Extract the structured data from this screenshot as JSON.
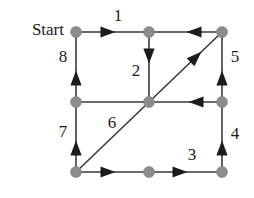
{
  "figure": {
    "type": "directed-graph-traversal",
    "background_color": "#ffffff",
    "node_color": "#8c8c8c",
    "edge_color": "#3a3a3a",
    "arrow_color": "#1c1c1c",
    "label_color": "#1a1a1a",
    "start_label": "Start"
  },
  "nodes": [
    {
      "id": "n-top-left",
      "cx": 76,
      "cy": 32,
      "r": 5.5
    },
    {
      "id": "n-top-mid",
      "cx": 149,
      "cy": 32,
      "r": 5.5
    },
    {
      "id": "n-top-right",
      "cx": 222,
      "cy": 32,
      "r": 5.5
    },
    {
      "id": "n-mid-left",
      "cx": 76,
      "cy": 102,
      "r": 5.5
    },
    {
      "id": "n-mid-center",
      "cx": 149,
      "cy": 102,
      "r": 5.5
    },
    {
      "id": "n-mid-right",
      "cx": 222,
      "cy": 102,
      "r": 5.5
    },
    {
      "id": "n-bottom-left",
      "cx": 76,
      "cy": 172,
      "r": 5.5
    },
    {
      "id": "n-bottom-mid",
      "cx": 149,
      "cy": 172,
      "r": 5.5
    },
    {
      "id": "n-bottom-right",
      "cx": 222,
      "cy": 172,
      "r": 5.5
    }
  ],
  "edges": [
    {
      "id": "edge-1",
      "label": "1",
      "from": "n-top-left",
      "to": "n-top-mid",
      "x1": 76,
      "y1": 32,
      "x2": 149,
      "y2": 32,
      "direction": "right",
      "arrow_x": 108,
      "arrow_y": 32,
      "label_x": 118,
      "label_y": 17
    },
    {
      "id": "edge-2",
      "label": "2",
      "from": "n-top-mid",
      "to": "n-mid-center",
      "x1": 149,
      "y1": 32,
      "x2": 149,
      "y2": 102,
      "direction": "down",
      "arrow_x": 149,
      "arrow_y": 56,
      "label_x": 136,
      "label_y": 72
    },
    {
      "id": "edge-3",
      "label": "3",
      "from": "n-bottom-mid",
      "to": "n-bottom-right",
      "x1": 149,
      "y1": 172,
      "x2": 222,
      "y2": 172,
      "direction": "right",
      "arrow_x": 180,
      "arrow_y": 172,
      "label_x": 192,
      "label_y": 156
    },
    {
      "id": "edge-4",
      "label": "4",
      "from": "n-bottom-right",
      "to": "n-mid-right",
      "x1": 222,
      "y1": 172,
      "x2": 222,
      "y2": 102,
      "direction": "up",
      "arrow_x": 222,
      "arrow_y": 148,
      "label_x": 235,
      "label_y": 135
    },
    {
      "id": "edge-5",
      "label": "5",
      "from": "n-mid-right",
      "to": "n-top-right",
      "x1": 222,
      "y1": 102,
      "x2": 222,
      "y2": 32,
      "direction": "up",
      "arrow_x": 222,
      "arrow_y": 78,
      "label_x": 235,
      "label_y": 58
    },
    {
      "id": "edge-6",
      "label": "6",
      "from": "n-bottom-left",
      "to": "n-top-right",
      "x1": 76,
      "y1": 172,
      "x2": 222,
      "y2": 32,
      "direction": "up-right",
      "arrow_x": 196,
      "arrow_y": 57,
      "label_x": 112,
      "label_y": 124
    },
    {
      "id": "edge-7",
      "label": "7",
      "from": "n-bottom-left",
      "to": "n-mid-left",
      "x1": 76,
      "y1": 172,
      "x2": 76,
      "y2": 102,
      "direction": "up",
      "arrow_x": 76,
      "arrow_y": 148,
      "label_x": 63,
      "label_y": 133
    },
    {
      "id": "edge-8",
      "label": "8",
      "from": "n-mid-left",
      "to": "n-top-left",
      "x1": 76,
      "y1": 102,
      "x2": 76,
      "y2": 32,
      "direction": "up",
      "arrow_x": 76,
      "arrow_y": 78,
      "label_x": 63,
      "label_y": 58
    },
    {
      "id": "edge-unlabeled-top-right",
      "label": "",
      "from": "n-top-right",
      "to": "n-top-mid",
      "x1": 222,
      "y1": 32,
      "x2": 149,
      "y2": 32,
      "direction": "left",
      "arrow_x": 194,
      "arrow_y": 32,
      "label_x": 0,
      "label_y": 0
    },
    {
      "id": "edge-unlabeled-mid-right",
      "label": "",
      "from": "n-mid-right",
      "to": "n-mid-center",
      "x1": 222,
      "y1": 102,
      "x2": 76,
      "y2": 102,
      "direction": "left",
      "arrow_x": 196,
      "arrow_y": 102,
      "label_x": 0,
      "label_y": 0
    },
    {
      "id": "edge-unlabeled-bottom-left",
      "label": "",
      "from": "n-bottom-left",
      "to": "n-bottom-mid",
      "x1": 76,
      "y1": 172,
      "x2": 149,
      "y2": 172,
      "direction": "right",
      "arrow_x": 108,
      "arrow_y": 172,
      "label_x": 0,
      "label_y": 0
    }
  ],
  "start_marker": {
    "text": "Start",
    "x": 64,
    "y": 31
  }
}
